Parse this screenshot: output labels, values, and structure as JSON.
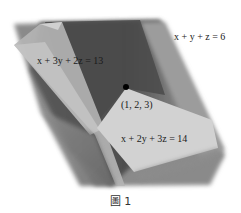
{
  "figure": {
    "planes": [
      {
        "id": "plane-1",
        "equation": "x + y + z = 6",
        "fill": "#6e6e6e"
      },
      {
        "id": "plane-2",
        "equation": "x + 3y + 2z = 13",
        "fill": "#b9b9b9"
      },
      {
        "id": "plane-3",
        "equation": "x + 2y + 3z = 14",
        "fill": "#cfcfcf"
      }
    ],
    "intersection_point": {
      "label": "(1, 2, 3)",
      "color": "#000000"
    },
    "caption": "圖 1"
  }
}
